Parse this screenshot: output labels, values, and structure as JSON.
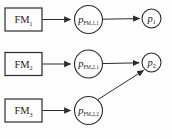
{
  "diagram": {
    "name": "fault-mechanism-probability-network",
    "colors": {
      "stroke": "#2b2b2b",
      "text": "#1c1c1c",
      "background": "#fdfdfd"
    },
    "nodes": {
      "fm1": {
        "type": "rect",
        "label": "FM",
        "sub": "1"
      },
      "fm2": {
        "type": "rect",
        "label": "FM",
        "sub": "2"
      },
      "fm3": {
        "type": "rect",
        "label": "FM",
        "sub": "3"
      },
      "pfm11": {
        "type": "circle",
        "label": "p",
        "sub": "FM,1,1"
      },
      "pfm21": {
        "type": "circle",
        "label": "p",
        "sub": "FM,2,1"
      },
      "pfm22": {
        "type": "circle",
        "label": "p",
        "sub": "FM,2,2"
      },
      "p1": {
        "type": "circle",
        "label": "p",
        "sub": "1"
      },
      "p2": {
        "type": "circle",
        "label": "p",
        "sub": "2"
      }
    },
    "edges": [
      {
        "from": "fm1",
        "to": "pfm11"
      },
      {
        "from": "pfm11",
        "to": "p1"
      },
      {
        "from": "fm2",
        "to": "pfm21"
      },
      {
        "from": "pfm21",
        "to": "p2"
      },
      {
        "from": "fm3",
        "to": "pfm22"
      },
      {
        "from": "pfm22",
        "to": "p2"
      }
    ]
  }
}
